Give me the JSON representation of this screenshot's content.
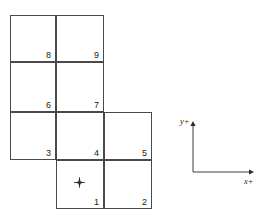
{
  "diagram": {
    "background_color": "#ffffff",
    "line_color": "#4a4a4a",
    "text_color": "#1a1a1a",
    "cells": [
      {
        "label": "8",
        "x": 10,
        "y": 15,
        "w": 46,
        "h": 47
      },
      {
        "label": "9",
        "x": 56,
        "y": 15,
        "w": 48,
        "h": 47
      },
      {
        "label": "6",
        "x": 10,
        "y": 62,
        "w": 46,
        "h": 50
      },
      {
        "label": "7",
        "x": 56,
        "y": 62,
        "w": 48,
        "h": 50
      },
      {
        "label": "3",
        "x": 10,
        "y": 112,
        "w": 46,
        "h": 48
      },
      {
        "label": "4",
        "x": 56,
        "y": 112,
        "w": 48,
        "h": 48
      },
      {
        "label": "5",
        "x": 104,
        "y": 112,
        "w": 48,
        "h": 48
      },
      {
        "label": "1",
        "x": 56,
        "y": 160,
        "w": 48,
        "h": 49
      },
      {
        "label": "2",
        "x": 104,
        "y": 160,
        "w": 48,
        "h": 49
      }
    ],
    "origin_marker": {
      "name": "origin-point",
      "x": 74,
      "y": 177,
      "size": 11
    },
    "axis_indicator": {
      "origin_x": 193,
      "origin_y": 172,
      "y_top": 121,
      "x_right": 254,
      "x_label": "x+",
      "y_label": "y+"
    }
  }
}
